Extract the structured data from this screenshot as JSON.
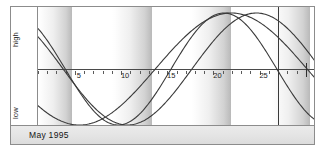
{
  "axis_labels": {
    "high": "high",
    "low": "low"
  },
  "caption": {
    "text": "May 1995"
  },
  "chart_data": {
    "type": "line",
    "title": "May 1995",
    "xlabel": "",
    "ylabel": "",
    "grid": false,
    "legend": "none",
    "xlim": [
      1,
      31
    ],
    "ylim": [
      -1,
      1
    ],
    "ytick_labels": [
      "high",
      "low"
    ],
    "xtick_labels": [
      "5",
      "10",
      "15",
      "20",
      "25"
    ],
    "xticks": [
      5,
      10,
      15,
      20,
      25
    ],
    "minor_xticks_every": 1,
    "annotations": [
      {
        "name": "today-marker",
        "type": "vline",
        "x": 27
      },
      {
        "name": "month-end-tick",
        "type": "tick",
        "x": 30
      }
    ],
    "background_bands": {
      "name": "weekly-gradient-bands",
      "period_days": 4.3,
      "gradient": [
        "#ffffff",
        "#b9b9b9"
      ]
    },
    "series": [
      {
        "name": "physical",
        "color": "#3a3a3a",
        "period_days": 23,
        "phase_deg": 118,
        "amplitude": 1.0,
        "x": [
          1,
          2,
          3,
          4,
          5,
          6,
          7,
          8,
          9,
          10,
          11,
          12,
          13,
          14,
          15,
          16,
          17,
          18,
          19,
          20,
          21,
          22,
          23,
          24,
          25,
          26,
          27,
          28,
          29,
          30,
          31
        ],
        "values": [
          0.6,
          0.4,
          0.18,
          -0.05,
          -0.28,
          -0.49,
          -0.67,
          -0.82,
          -0.93,
          -0.99,
          -1.0,
          -0.96,
          -0.87,
          -0.74,
          -0.57,
          -0.37,
          -0.15,
          0.08,
          0.31,
          0.52,
          0.7,
          0.85,
          0.95,
          1.0,
          0.99,
          0.92,
          0.8,
          0.63,
          0.43,
          0.21,
          -0.02
        ]
      },
      {
        "name": "emotional",
        "color": "#3a3a3a",
        "period_days": 28,
        "phase_deg": 132,
        "amplitude": 1.0,
        "x": [
          1,
          2,
          3,
          4,
          5,
          6,
          7,
          8,
          9,
          10,
          11,
          12,
          13,
          14,
          15,
          16,
          17,
          18,
          19,
          20,
          21,
          22,
          23,
          24,
          25,
          26,
          27,
          28,
          29,
          30,
          31
        ],
        "values": [
          0.74,
          0.6,
          0.43,
          0.25,
          0.05,
          -0.16,
          -0.36,
          -0.54,
          -0.71,
          -0.84,
          -0.94,
          -0.99,
          -1.0,
          -0.97,
          -0.89,
          -0.77,
          -0.62,
          -0.43,
          -0.22,
          -0.01,
          0.21,
          0.41,
          0.59,
          0.75,
          0.88,
          0.96,
          1.0,
          0.98,
          0.92,
          0.81,
          0.66
        ]
      },
      {
        "name": "intellectual",
        "color": "#3a3a3a",
        "period_days": 33,
        "phase_deg": 210,
        "amplitude": 1.0,
        "x": [
          1,
          2,
          3,
          4,
          5,
          6,
          7,
          8,
          9,
          10,
          11,
          12,
          13,
          14,
          15,
          16,
          17,
          18,
          19,
          20,
          21,
          22,
          23,
          24,
          25,
          26,
          27,
          28,
          29,
          30,
          31
        ],
        "values": [
          -0.5,
          -0.66,
          -0.8,
          -0.9,
          -0.97,
          -1.0,
          -0.99,
          -0.94,
          -0.86,
          -0.74,
          -0.59,
          -0.42,
          -0.23,
          -0.03,
          0.17,
          0.37,
          0.55,
          0.71,
          0.84,
          0.94,
          0.99,
          1.0,
          0.97,
          0.89,
          0.78,
          0.63,
          0.45,
          0.26,
          0.06,
          -0.15,
          -0.35
        ]
      }
    ]
  }
}
